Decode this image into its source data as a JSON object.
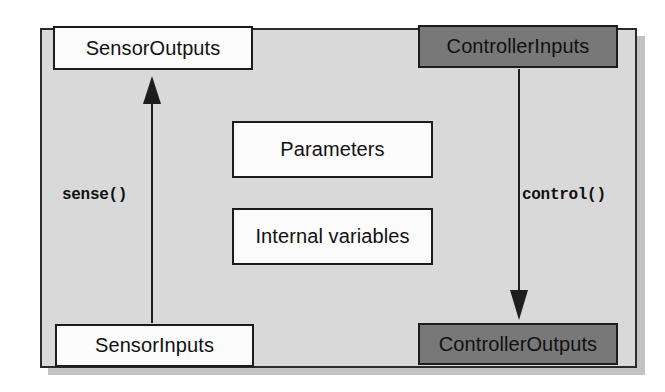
{
  "diagram": {
    "frame": {
      "name": "system-boundary",
      "background_color": "#d9d9d9",
      "border_color": "#2b2b2b"
    },
    "nodes": [
      {
        "id": "sensor-outputs",
        "label": "SensorOutputs",
        "style": "light",
        "fill_color": "#fbfbfb"
      },
      {
        "id": "controller-inputs",
        "label": "ControllerInputs",
        "style": "dark",
        "fill_color": "#787878"
      },
      {
        "id": "parameters",
        "label": "Parameters",
        "style": "light-shadowed",
        "fill_color": "#fbfbfb"
      },
      {
        "id": "internal-variables",
        "label": "Internal variables",
        "style": "light-shadowed",
        "fill_color": "#fbfbfb"
      },
      {
        "id": "sensor-inputs",
        "label": "SensorInputs",
        "style": "light",
        "fill_color": "#fbfbfb"
      },
      {
        "id": "controller-outputs",
        "label": "ControllerOutputs",
        "style": "dark",
        "fill_color": "#787878"
      }
    ],
    "arrows": [
      {
        "id": "sense",
        "label": "sense()",
        "direction": "up",
        "from": "SensorInputs",
        "to": "SensorOutputs"
      },
      {
        "id": "control",
        "label": "control()",
        "direction": "down",
        "from": "ControllerInputs",
        "to": "ControllerOutputs"
      }
    ]
  }
}
